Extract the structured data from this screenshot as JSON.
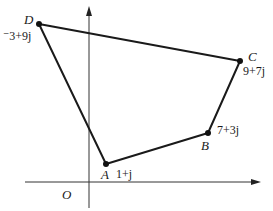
{
  "diagram": {
    "type": "argand-diagram-quadrilateral",
    "origin_label": "O",
    "colors": {
      "line": "#1a1a1a",
      "axis": "#333333",
      "point": "#111111",
      "background": "#ffffff"
    },
    "points": [
      {
        "name": "A",
        "value": "1+j"
      },
      {
        "name": "B",
        "value": "7+3j"
      },
      {
        "name": "C",
        "value": "9+7j"
      },
      {
        "name": "D",
        "value": "⁻3+9j"
      }
    ]
  }
}
